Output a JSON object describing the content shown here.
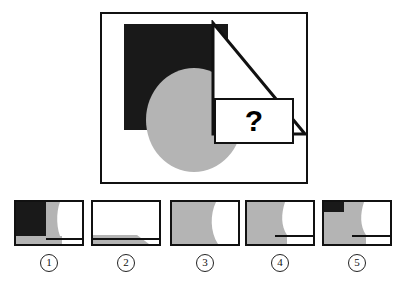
{
  "colors": {
    "black_fill": "#191919",
    "gray_fill": "#b4b4b4",
    "white_fill": "#ffffff",
    "outline": "#111111",
    "page_background": "#ffffff"
  },
  "stimulus": {
    "name": "shape-overlap-puzzle",
    "frame_border_color": "#111111",
    "question_text": "?",
    "shapes": [
      {
        "id": "black-square",
        "kind": "square",
        "fill": "#191919",
        "outline": "none",
        "label": "black square"
      },
      {
        "id": "gray-circle",
        "kind": "circle",
        "fill": "#b4b4b4",
        "outline": "none",
        "label": "gray circle"
      },
      {
        "id": "triangle-outline",
        "kind": "right-triangle",
        "fill": "none",
        "outline": "#111111",
        "label": "white outlined triangle"
      },
      {
        "id": "question-card",
        "kind": "rectangle",
        "fill": "#ffffff",
        "outline": "#111111",
        "label": "white question card"
      }
    ]
  },
  "options": [
    {
      "number": "1",
      "name": "option-1",
      "description": "black rectangle at left with gray curved band beside it, gray strip along the bottom and a white notch at lower right",
      "parts": [
        {
          "shape": "rect",
          "fill": "#191919",
          "x": 0,
          "y": 0,
          "w": 30,
          "h": 34
        },
        {
          "shape": "curve",
          "fill": "#b4b4b4",
          "x": 0,
          "y": 0,
          "w": 46,
          "h": 38
        },
        {
          "shape": "rect",
          "fill": "#b4b4b4",
          "x": 0,
          "y": 34,
          "w": 46,
          "h": 8
        },
        {
          "shape": "line",
          "fill": "#111111",
          "x": 30,
          "y": 36,
          "w": 36,
          "h": 2
        }
      ]
    },
    {
      "number": "2",
      "name": "option-2",
      "description": "mostly white with a gray strip across the bottom-left and a white triangular notch at the bottom right",
      "parts": [
        {
          "shape": "rect",
          "fill": "#b4b4b4",
          "x": 0,
          "y": 33,
          "w": 42,
          "h": 9
        },
        {
          "shape": "line",
          "fill": "#111111",
          "x": 0,
          "y": 36,
          "w": 66,
          "h": 2
        }
      ]
    },
    {
      "number": "3",
      "name": "option-3",
      "description": "large gray region filling the left with a convex curved right edge, white at the right",
      "parts": [
        {
          "shape": "curve",
          "fill": "#b4b4b4",
          "x": 0,
          "y": 0,
          "w": 48,
          "h": 42
        }
      ]
    },
    {
      "number": "4",
      "name": "option-4",
      "description": "gray region at the left with curved right edge, white at right, horizontal rule near the bottom right",
      "parts": [
        {
          "shape": "curve",
          "fill": "#b4b4b4",
          "x": 0,
          "y": 0,
          "w": 42,
          "h": 42
        },
        {
          "shape": "line",
          "fill": "#111111",
          "x": 28,
          "y": 33,
          "w": 38,
          "h": 2
        }
      ]
    },
    {
      "number": "5",
      "name": "option-5",
      "description": "gray region at the left with a small black rectangle in the top-left corner, white at right, horizontal rule near the bottom right",
      "parts": [
        {
          "shape": "curve",
          "fill": "#b4b4b4",
          "x": 0,
          "y": 0,
          "w": 44,
          "h": 42
        },
        {
          "shape": "rect",
          "fill": "#191919",
          "x": 0,
          "y": 0,
          "w": 20,
          "h": 10
        },
        {
          "shape": "line",
          "fill": "#111111",
          "x": 28,
          "y": 33,
          "w": 38,
          "h": 2
        }
      ]
    }
  ]
}
